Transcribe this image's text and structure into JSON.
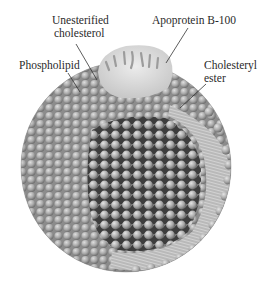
{
  "figure": {
    "labels": {
      "unesterified_cholesterol": [
        "Unesterified",
        "cholesterol"
      ],
      "apoprotein": "Apoprotein B-100",
      "phospholipid": "Phospholipid",
      "cholesteryl_ester": [
        "Cholesteryl",
        "ester"
      ]
    },
    "colors": {
      "background": "#ffffff",
      "sphere_surface": "#a9a9a9",
      "bead_light": "#d6d6d6",
      "bead_dark": "#7c7c7c",
      "core_shadow": "#3a3a3a",
      "membrane_band": "#b8b8b8",
      "apoprotein": "#dedede",
      "text": "#2a2a2a",
      "leader_line": "#333333"
    }
  }
}
